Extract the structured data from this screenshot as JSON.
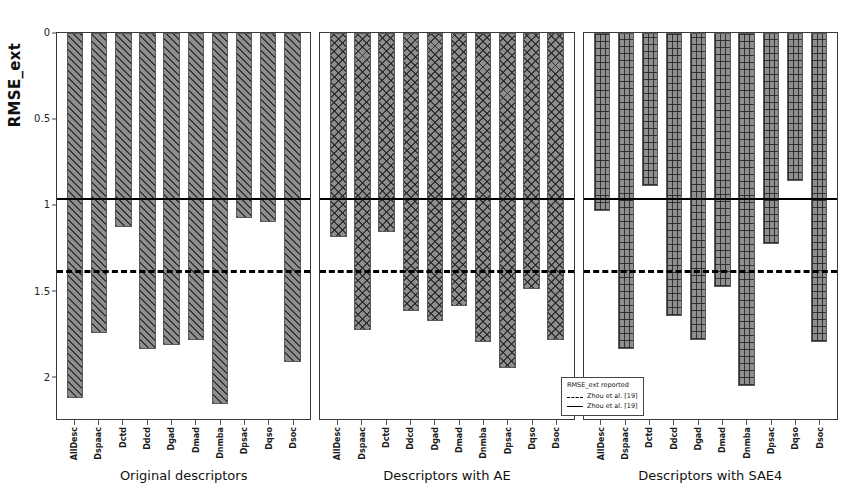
{
  "chart_data": {
    "type": "bar",
    "title": "",
    "ylabel": "RMSE_ext",
    "xlabel": "",
    "ylim": [
      0,
      2.25
    ],
    "y_inverted": true,
    "grid": false,
    "yticks": [
      {
        "value": 0,
        "label": "0"
      },
      {
        "value": 0.5,
        "label": "0.5"
      },
      {
        "value": 1,
        "label": "1"
      },
      {
        "value": 1.5,
        "label": "1.5"
      },
      {
        "value": 2,
        "label": "2"
      }
    ],
    "categories": [
      "AllDesc",
      "Dspaac",
      "Dctd",
      "Ddcd",
      "Dgad",
      "Dmad",
      "Dnmba",
      "Dpsac",
      "Dqso",
      "Dsoc"
    ],
    "panels": [
      {
        "name": "panel-original",
        "caption": "Original descriptors",
        "pattern": "diagonal-hatch",
        "values": [
          2.13,
          1.75,
          1.13,
          1.84,
          1.82,
          1.79,
          2.16,
          1.08,
          1.1,
          1.92
        ]
      },
      {
        "name": "panel-ae",
        "caption": "Descriptors with AE",
        "pattern": "cross-hatch",
        "values": [
          1.19,
          1.73,
          1.16,
          1.62,
          1.68,
          1.59,
          1.8,
          1.95,
          1.49,
          1.79
        ]
      },
      {
        "name": "panel-sae4",
        "caption": "Descriptors with SAE4",
        "pattern": "grid-hatch",
        "values": [
          1.04,
          1.84,
          0.89,
          1.65,
          1.79,
          1.48,
          2.06,
          1.23,
          0.86,
          1.8
        ]
      }
    ],
    "reference_lines": [
      {
        "name": "zhou-solid",
        "value": 0.96,
        "style": "solid",
        "label": "Zhou et al. [19]"
      },
      {
        "name": "zhou-dashed",
        "value": 1.38,
        "style": "dashed",
        "label": "Zhou et al. [19]"
      }
    ],
    "legend": {
      "position": "bottom-right-panel3",
      "title": "RMSE_ext reported",
      "entries": [
        {
          "style": "dashed",
          "label": "Zhou et al. [19]"
        },
        {
          "style": "solid",
          "label": "Zhou et al. [19]"
        }
      ]
    },
    "colors": {
      "bar_face": "#8e8e8e",
      "bar_edge": "#5a5a5a",
      "hatch": "#232323",
      "reference_line": "#000000",
      "axis": "#3a3a3a",
      "background": "#ffffff"
    }
  }
}
